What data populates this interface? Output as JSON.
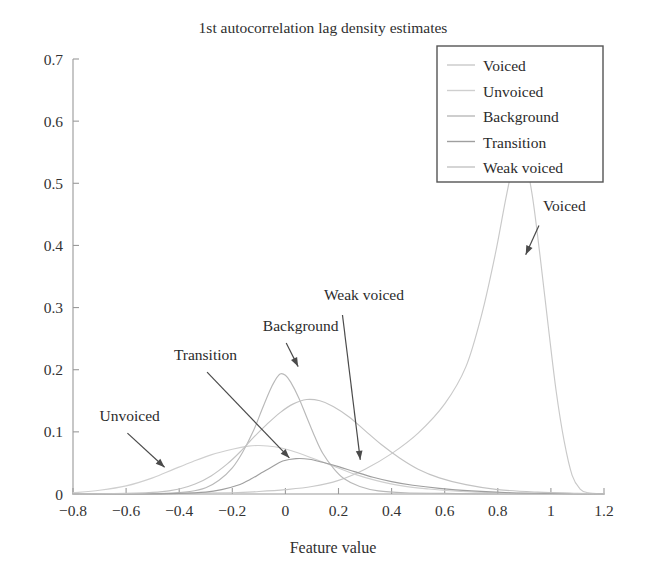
{
  "chart_data": {
    "type": "line",
    "title": "1st autocorrelation lag density estimates",
    "xlabel": "Feature value",
    "ylabel": "",
    "xlim": [
      -0.8,
      1.2
    ],
    "ylim": [
      0,
      0.7
    ],
    "grid": false,
    "legend_position": "top-right",
    "xticks": [
      "-0.8",
      "-0.6",
      "-0.4",
      "-0.2",
      "0",
      "0.2",
      "0.4",
      "0.6",
      "0.8",
      "1",
      "1.2"
    ],
    "xtick_values": [
      -0.8,
      -0.6,
      -0.4,
      -0.2,
      0,
      0.2,
      0.4,
      0.6,
      0.8,
      1,
      1.2
    ],
    "yticks": [
      "0",
      "0.1",
      "0.2",
      "0.3",
      "0.4",
      "0.5",
      "0.6",
      "0.7"
    ],
    "ytick_values": [
      0,
      0.1,
      0.2,
      0.3,
      0.4,
      0.5,
      0.6,
      0.7
    ],
    "series": [
      {
        "name": "Voiced",
        "color": "#c9c9c9",
        "peak_x": 0.88,
        "peak_y": 0.56,
        "values": [
          {
            "x": -0.8,
            "y": 0.0
          },
          {
            "x": -0.6,
            "y": 0.0
          },
          {
            "x": -0.4,
            "y": 0.001
          },
          {
            "x": -0.2,
            "y": 0.002
          },
          {
            "x": -0.1,
            "y": 0.004
          },
          {
            "x": 0.0,
            "y": 0.007
          },
          {
            "x": 0.1,
            "y": 0.012
          },
          {
            "x": 0.2,
            "y": 0.022
          },
          {
            "x": 0.3,
            "y": 0.04
          },
          {
            "x": 0.4,
            "y": 0.065
          },
          {
            "x": 0.5,
            "y": 0.098
          },
          {
            "x": 0.6,
            "y": 0.145
          },
          {
            "x": 0.68,
            "y": 0.205
          },
          {
            "x": 0.74,
            "y": 0.29
          },
          {
            "x": 0.79,
            "y": 0.385
          },
          {
            "x": 0.83,
            "y": 0.475
          },
          {
            "x": 0.86,
            "y": 0.535
          },
          {
            "x": 0.88,
            "y": 0.56
          },
          {
            "x": 0.9,
            "y": 0.545
          },
          {
            "x": 0.93,
            "y": 0.48
          },
          {
            "x": 0.96,
            "y": 0.38
          },
          {
            "x": 0.99,
            "y": 0.27
          },
          {
            "x": 1.02,
            "y": 0.165
          },
          {
            "x": 1.05,
            "y": 0.085
          },
          {
            "x": 1.08,
            "y": 0.03
          },
          {
            "x": 1.11,
            "y": 0.008
          },
          {
            "x": 1.14,
            "y": 0.002
          },
          {
            "x": 1.2,
            "y": 0.0
          }
        ]
      },
      {
        "name": "Unvoiced",
        "color": "#cfcfcf",
        "peak_x": -0.1,
        "peak_y": 0.078,
        "values": [
          {
            "x": -0.8,
            "y": 0.002
          },
          {
            "x": -0.7,
            "y": 0.006
          },
          {
            "x": -0.6,
            "y": 0.013
          },
          {
            "x": -0.5,
            "y": 0.026
          },
          {
            "x": -0.42,
            "y": 0.04
          },
          {
            "x": -0.35,
            "y": 0.052
          },
          {
            "x": -0.28,
            "y": 0.063
          },
          {
            "x": -0.2,
            "y": 0.072
          },
          {
            "x": -0.14,
            "y": 0.077
          },
          {
            "x": -0.1,
            "y": 0.078
          },
          {
            "x": -0.04,
            "y": 0.076
          },
          {
            "x": 0.02,
            "y": 0.07
          },
          {
            "x": 0.1,
            "y": 0.058
          },
          {
            "x": 0.18,
            "y": 0.045
          },
          {
            "x": 0.26,
            "y": 0.032
          },
          {
            "x": 0.34,
            "y": 0.022
          },
          {
            "x": 0.44,
            "y": 0.013
          },
          {
            "x": 0.54,
            "y": 0.008
          },
          {
            "x": 0.66,
            "y": 0.004
          },
          {
            "x": 0.8,
            "y": 0.002
          },
          {
            "x": 0.95,
            "y": 0.001
          },
          {
            "x": 1.2,
            "y": 0.0
          }
        ]
      },
      {
        "name": "Background",
        "color": "#b9b9b9",
        "peak_x": -0.02,
        "peak_y": 0.193,
        "values": [
          {
            "x": -0.8,
            "y": 0.0
          },
          {
            "x": -0.6,
            "y": 0.0
          },
          {
            "x": -0.45,
            "y": 0.001
          },
          {
            "x": -0.36,
            "y": 0.004
          },
          {
            "x": -0.3,
            "y": 0.01
          },
          {
            "x": -0.25,
            "y": 0.022
          },
          {
            "x": -0.2,
            "y": 0.042
          },
          {
            "x": -0.16,
            "y": 0.068
          },
          {
            "x": -0.12,
            "y": 0.102
          },
          {
            "x": -0.09,
            "y": 0.134
          },
          {
            "x": -0.06,
            "y": 0.165
          },
          {
            "x": -0.04,
            "y": 0.182
          },
          {
            "x": -0.02,
            "y": 0.193
          },
          {
            "x": 0.0,
            "y": 0.191
          },
          {
            "x": 0.02,
            "y": 0.18
          },
          {
            "x": 0.05,
            "y": 0.155
          },
          {
            "x": 0.08,
            "y": 0.124
          },
          {
            "x": 0.11,
            "y": 0.093
          },
          {
            "x": 0.14,
            "y": 0.066
          },
          {
            "x": 0.18,
            "y": 0.042
          },
          {
            "x": 0.22,
            "y": 0.025
          },
          {
            "x": 0.28,
            "y": 0.012
          },
          {
            "x": 0.35,
            "y": 0.005
          },
          {
            "x": 0.45,
            "y": 0.002
          },
          {
            "x": 0.6,
            "y": 0.001
          },
          {
            "x": 0.8,
            "y": 0.0
          },
          {
            "x": 1.2,
            "y": 0.0
          }
        ]
      },
      {
        "name": "Transition",
        "color": "#9f9f9f",
        "peak_x": 0.04,
        "peak_y": 0.057,
        "values": [
          {
            "x": -0.8,
            "y": 0.0
          },
          {
            "x": -0.55,
            "y": 0.0
          },
          {
            "x": -0.4,
            "y": 0.001
          },
          {
            "x": -0.3,
            "y": 0.003
          },
          {
            "x": -0.24,
            "y": 0.007
          },
          {
            "x": -0.18,
            "y": 0.014
          },
          {
            "x": -0.13,
            "y": 0.024
          },
          {
            "x": -0.09,
            "y": 0.034
          },
          {
            "x": -0.05,
            "y": 0.044
          },
          {
            "x": -0.01,
            "y": 0.053
          },
          {
            "x": 0.04,
            "y": 0.057
          },
          {
            "x": 0.09,
            "y": 0.056
          },
          {
            "x": 0.14,
            "y": 0.051
          },
          {
            "x": 0.2,
            "y": 0.044
          },
          {
            "x": 0.26,
            "y": 0.036
          },
          {
            "x": 0.33,
            "y": 0.027
          },
          {
            "x": 0.4,
            "y": 0.02
          },
          {
            "x": 0.48,
            "y": 0.014
          },
          {
            "x": 0.58,
            "y": 0.009
          },
          {
            "x": 0.7,
            "y": 0.005
          },
          {
            "x": 0.85,
            "y": 0.002
          },
          {
            "x": 1.0,
            "y": 0.001
          },
          {
            "x": 1.2,
            "y": 0.0
          }
        ]
      },
      {
        "name": "Weak voiced",
        "color": "#c3c3c3",
        "peak_x": 0.08,
        "peak_y": 0.152,
        "values": [
          {
            "x": -0.8,
            "y": 0.0
          },
          {
            "x": -0.6,
            "y": 0.001
          },
          {
            "x": -0.48,
            "y": 0.003
          },
          {
            "x": -0.4,
            "y": 0.008
          },
          {
            "x": -0.34,
            "y": 0.016
          },
          {
            "x": -0.28,
            "y": 0.029
          },
          {
            "x": -0.22,
            "y": 0.048
          },
          {
            "x": -0.17,
            "y": 0.068
          },
          {
            "x": -0.12,
            "y": 0.091
          },
          {
            "x": -0.07,
            "y": 0.112
          },
          {
            "x": -0.02,
            "y": 0.131
          },
          {
            "x": 0.03,
            "y": 0.145
          },
          {
            "x": 0.08,
            "y": 0.152
          },
          {
            "x": 0.13,
            "y": 0.15
          },
          {
            "x": 0.18,
            "y": 0.141
          },
          {
            "x": 0.24,
            "y": 0.124
          },
          {
            "x": 0.3,
            "y": 0.102
          },
          {
            "x": 0.36,
            "y": 0.08
          },
          {
            "x": 0.43,
            "y": 0.058
          },
          {
            "x": 0.5,
            "y": 0.04
          },
          {
            "x": 0.58,
            "y": 0.026
          },
          {
            "x": 0.68,
            "y": 0.015
          },
          {
            "x": 0.8,
            "y": 0.007
          },
          {
            "x": 0.95,
            "y": 0.003
          },
          {
            "x": 1.1,
            "y": 0.001
          },
          {
            "x": 1.2,
            "y": 0.0
          }
        ]
      }
    ],
    "annotations": [
      {
        "label": "Voiced",
        "text_x": 0.97,
        "text_y": 0.455,
        "arrow_from_x": 0.955,
        "arrow_from_y": 0.432,
        "arrow_to_x": 0.905,
        "arrow_to_y": 0.385
      },
      {
        "label": "Unvoiced",
        "text_x": -0.7,
        "text_y": 0.118,
        "arrow_from_x": -0.595,
        "arrow_from_y": 0.098,
        "arrow_to_x": -0.455,
        "arrow_to_y": 0.043
      },
      {
        "label": "Transition",
        "text_x": -0.42,
        "text_y": 0.215,
        "arrow_from_x": -0.295,
        "arrow_from_y": 0.196,
        "arrow_to_x": 0.015,
        "arrow_to_y": 0.058
      },
      {
        "label": "Background",
        "text_x": -0.085,
        "text_y": 0.262,
        "arrow_from_x": 0.003,
        "arrow_from_y": 0.243,
        "arrow_to_x": 0.048,
        "arrow_to_y": 0.205
      },
      {
        "label": "Weak voiced",
        "text_x": 0.145,
        "text_y": 0.312,
        "arrow_from_x": 0.215,
        "arrow_from_y": 0.288,
        "arrow_to_x": 0.282,
        "arrow_to_y": 0.055
      }
    ],
    "legend_entries": [
      {
        "label": "Voiced",
        "color": "#c9c9c9"
      },
      {
        "label": "Unvoiced",
        "color": "#cfcfcf"
      },
      {
        "label": "Background",
        "color": "#b9b9b9"
      },
      {
        "label": "Transition",
        "color": "#9f9f9f"
      },
      {
        "label": "Weak voiced",
        "color": "#c3c3c3"
      }
    ]
  }
}
